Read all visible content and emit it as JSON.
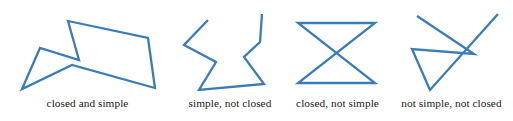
{
  "figure": {
    "background_color": "#ffffff",
    "stroke_color": "#3a7cb8",
    "stroke_width": 2.3,
    "width": 513,
    "height": 121
  },
  "panels": [
    {
      "id": "panel-1",
      "caption": "closed and simple",
      "closed": true,
      "simple": true,
      "points": "68,21 148,38 155,88 72,65 22,89 40,48 79,60"
    },
    {
      "id": "panel-2",
      "caption": "simple, not closed",
      "closed": false,
      "simple": true,
      "points": "208,20 184,45 216,62 199,90 264,84 244,57 260,42 262,14"
    },
    {
      "id": "panel-3",
      "caption": "closed, not simple",
      "closed": true,
      "simple": false,
      "points": "298,23 375,23 298,83 375,83"
    },
    {
      "id": "panel-4",
      "caption": "not simple, not closed",
      "closed": false,
      "simple": false,
      "points": "417,16 474,54 412,49 430,90 498,14"
    }
  ],
  "captions": {
    "one": "closed and simple",
    "two": "simple, not closed",
    "three": "closed, not simple",
    "four": "not simple, not closed"
  },
  "chart_data": {
    "type": "diagram",
    "items": [
      {
        "label": "closed and simple",
        "closed": true,
        "simple": true,
        "vertices": 7
      },
      {
        "label": "simple, not closed",
        "closed": false,
        "simple": true,
        "vertices": 8
      },
      {
        "label": "closed, not simple",
        "closed": true,
        "simple": false,
        "vertices": 4
      },
      {
        "label": "not simple, not closed",
        "closed": false,
        "simple": false,
        "vertices": 5
      }
    ]
  }
}
